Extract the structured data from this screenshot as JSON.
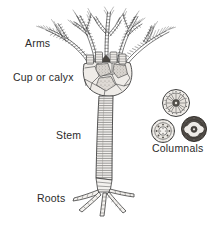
{
  "figure": {
    "kind": "scientific-line-drawing",
    "background_color": "#ffffff",
    "ink_color": "#3a3a3a",
    "fill_tone": "#cfcbc6",
    "stipple_tone": "#9a958f"
  },
  "labels": {
    "arms": "Arms",
    "cup_or_calyx": "Cup or calyx",
    "stem": "Stem",
    "roots": "Roots",
    "columnals": "Columnals"
  },
  "parts": {
    "arms": {
      "name": "arms",
      "count": 5,
      "description": "segmented branching arms with fine pinnules",
      "branch_levels": 3
    },
    "calyx": {
      "name": "cup-or-calyx",
      "description": "cup of polygonal plates",
      "plate_count": 11,
      "stippled_plates": 3
    },
    "stem": {
      "name": "stem",
      "description": "column of stacked disc segments",
      "segment_count": 34
    },
    "roots": {
      "name": "roots",
      "description": "splayed segmented radicles anchoring the stem",
      "radicle_count": 5
    },
    "columnals": {
      "name": "columnals",
      "description": "detached stem discs shown in cross-section",
      "discs": [
        {
          "id": "columnal-radiate",
          "position": "upper",
          "cx": 176,
          "cy": 103,
          "r": 14,
          "center_pattern": "radiating-star"
        },
        {
          "id": "columnal-beaded",
          "position": "lower-left",
          "cx": 163,
          "cy": 131,
          "r": 12,
          "center_pattern": "beaded-ring"
        },
        {
          "id": "columnal-lobed",
          "position": "lower-right",
          "cx": 194,
          "cy": 129,
          "r": 13,
          "center_pattern": "lobed-dark"
        }
      ]
    }
  }
}
